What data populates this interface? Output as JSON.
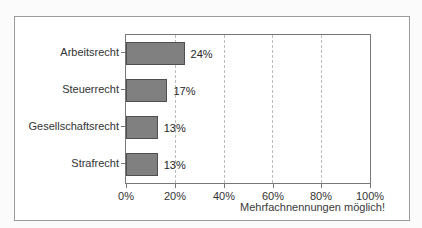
{
  "chart_data": {
    "type": "bar",
    "orientation": "horizontal",
    "categories": [
      "Arbeitsrecht",
      "Steuerrecht",
      "Gesellschaftsrecht",
      "Strafrecht"
    ],
    "values": [
      24,
      17,
      13,
      13
    ],
    "value_labels": [
      "24%",
      "17%",
      "13%",
      "13%"
    ],
    "x_tick_labels": [
      "0%",
      "20%",
      "40%",
      "60%",
      "80%",
      "100%"
    ],
    "xlim": [
      0,
      100
    ],
    "grid": "dashed vertical lines every 20%",
    "legend": "none",
    "title": "",
    "note": "Mehrfachnennungen möglich!",
    "bar_color": "#808080",
    "bar_border_color": "#4f4f4f"
  }
}
